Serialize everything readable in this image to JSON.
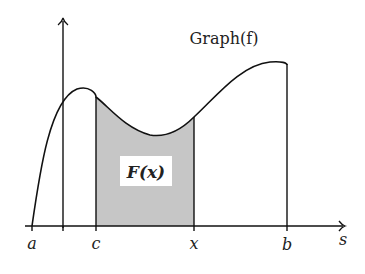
{
  "diagram": {
    "title": "Graph(f)",
    "area_label": "F(x)",
    "axis_label_s": "s",
    "tick_labels": {
      "a": "a",
      "c": "c",
      "x": "x",
      "b": "b"
    },
    "colors": {
      "stroke": "#111111",
      "shaded_area": "#c6c6c6",
      "label_box": "#ffffff",
      "background": "#ffffff"
    }
  }
}
